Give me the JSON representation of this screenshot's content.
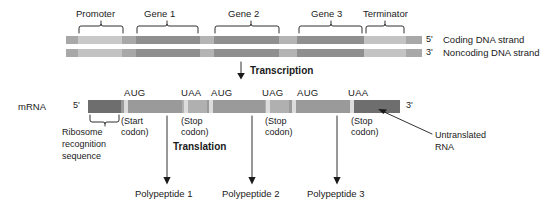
{
  "figure": {
    "background": "#ffffff",
    "ink": "#1a1a1a"
  },
  "colors": {
    "dna_light": "#c9c9c9",
    "dna_mid": "#a8a8a8",
    "dna_dark": "#8f8f8f",
    "mrna_dark": "#6e6e6e",
    "mrna_mid": "#9a9a9a",
    "mrna_light": "#b5b5b5",
    "codon_marker": "#d8d8d8",
    "line": "#1a1a1a"
  },
  "dna": {
    "top_labels": [
      {
        "text": "Promoter",
        "x": 103,
        "y": 14
      },
      {
        "text": "Gene 1",
        "x": 162,
        "y": 14
      },
      {
        "text": "Gene 2",
        "x": 253,
        "y": 14
      },
      {
        "text": "Gene 3",
        "x": 343,
        "y": 14
      },
      {
        "text": "Terminator",
        "x": 404,
        "y": 14
      }
    ],
    "strands": [
      {
        "name": "coding",
        "prime_label": "5'",
        "strand_label": "Coding DNA strand",
        "y": 36
      },
      {
        "name": "noncoding",
        "prime_label": "3'",
        "strand_label": "Noncoding DNA strand",
        "y": 48
      }
    ],
    "segments": [
      {
        "name": "upstream",
        "x": 66,
        "w": 12,
        "shade": "dna_mid"
      },
      {
        "name": "promoter",
        "x": 78,
        "w": 44,
        "shade": "dna_light"
      },
      {
        "name": "spacer-1",
        "x": 122,
        "w": 14,
        "shade": "dna_mid"
      },
      {
        "name": "gene-1",
        "x": 136,
        "w": 64,
        "shade": "dna_dark"
      },
      {
        "name": "spacer-2",
        "x": 200,
        "w": 14,
        "shade": "dna_mid"
      },
      {
        "name": "gene-2",
        "x": 214,
        "w": 65,
        "shade": "dna_dark"
      },
      {
        "name": "spacer-3",
        "x": 279,
        "w": 18,
        "shade": "dna_mid"
      },
      {
        "name": "gene-3",
        "x": 297,
        "w": 67,
        "shade": "dna_dark"
      },
      {
        "name": "terminator",
        "x": 364,
        "w": 42,
        "shade": "dna_light"
      },
      {
        "name": "downstream",
        "x": 406,
        "w": 16,
        "shade": "dna_mid"
      }
    ]
  },
  "transcription": {
    "label": "Transcription"
  },
  "mrna": {
    "row_label": "mRNA",
    "five_prime": "5'",
    "three_prime": "3'",
    "bar": {
      "x": 88,
      "y": 100,
      "w": 312,
      "h": 13
    },
    "segments": [
      {
        "name": "ribosome-recognition",
        "x": 88,
        "w": 33,
        "shade": "mrna_dark"
      },
      {
        "name": "orf-1",
        "x": 121,
        "w": 61,
        "shade": "mrna_mid"
      },
      {
        "name": "intergenic-1",
        "x": 182,
        "w": 25,
        "shade": "mrna_light"
      },
      {
        "name": "orf-2",
        "x": 207,
        "w": 58,
        "shade": "mrna_mid"
      },
      {
        "name": "intergenic-2",
        "x": 265,
        "w": 24,
        "shade": "mrna_light"
      },
      {
        "name": "orf-3",
        "x": 289,
        "w": 64,
        "shade": "mrna_mid"
      },
      {
        "name": "untranslated-tail",
        "x": 353,
        "w": 47,
        "shade": "mrna_dark"
      }
    ],
    "codon_markers": [
      {
        "name": "start-codon-1",
        "x": 124
      },
      {
        "name": "stop-codon-1",
        "x": 184
      },
      {
        "name": "start-codon-2",
        "x": 209
      },
      {
        "name": "stop-codon-2",
        "x": 266
      },
      {
        "name": "start-codon-3",
        "x": 292
      },
      {
        "name": "stop-codon-3",
        "x": 352
      }
    ],
    "codon_labels": [
      {
        "name": "codon-label-aug-1",
        "text": "AUG",
        "x": 125,
        "y": 90
      },
      {
        "name": "codon-label-uaa-1",
        "text": "UAA",
        "x": 182,
        "y": 90
      },
      {
        "name": "codon-label-aug-2",
        "text": "AUG",
        "x": 212,
        "y": 90
      },
      {
        "name": "codon-label-uag-1",
        "text": "UAG",
        "x": 262,
        "y": 90
      },
      {
        "name": "codon-label-aug-3",
        "text": "AUG",
        "x": 297,
        "y": 90
      },
      {
        "name": "codon-label-uaa-2",
        "text": "UAA",
        "x": 349,
        "y": 90
      }
    ]
  },
  "annotations": {
    "ribosome_sequence": {
      "lines": [
        "Ribosome",
        "recognition",
        "sequence"
      ],
      "x": 63,
      "y": 129
    },
    "start_codon": {
      "lines": [
        "(Start",
        "codon)"
      ],
      "x": 121,
      "y": 120
    },
    "stop_codon_1": {
      "lines": [
        "(Stop",
        "codon)"
      ],
      "x": 181,
      "y": 120
    },
    "stop_codon_2": {
      "lines": [
        "(Stop",
        "codon)"
      ],
      "x": 265,
      "y": 120
    },
    "stop_codon_3": {
      "lines": [
        "(Stop",
        "codon)"
      ],
      "x": 351,
      "y": 120
    },
    "untranslated_rna": {
      "lines": [
        "Untranslated",
        "RNA"
      ],
      "x": 432,
      "y": 131
    }
  },
  "translation": {
    "label": "Translation",
    "label_x": 172,
    "label_y": 145,
    "products": [
      {
        "name": "polypeptide-1",
        "text": "Polypeptide 1",
        "x": 168,
        "y": 190,
        "arrow_x": 167
      },
      {
        "name": "polypeptide-2",
        "text": "Polypeptide 2",
        "x": 253,
        "y": 190,
        "arrow_x": 252
      },
      {
        "name": "polypeptide-3",
        "text": "Polypeptide 3",
        "x": 338,
        "y": 190,
        "arrow_x": 337
      }
    ]
  }
}
